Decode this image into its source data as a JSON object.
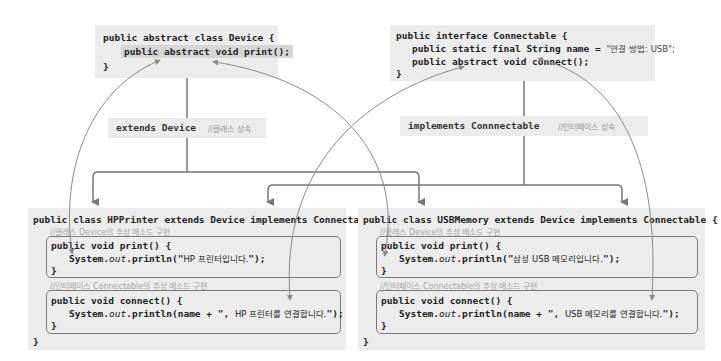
{
  "device": {
    "line1": "public abstract class Device {",
    "line2": "public abstract void print();",
    "line3": "}"
  },
  "connectable": {
    "line1": "public interface Connectable {",
    "line2_prefix": "public static final String name = ",
    "line2_value": "\"연결 방법: USB\";",
    "line3": "public abstract void connect();",
    "line4": "}"
  },
  "extends_label": {
    "keyword": "extends Device",
    "comment": "//클래스 상속"
  },
  "implements_label": {
    "keyword": "implements Connnectable",
    "comment": "//인터페이스 상속"
  },
  "hpprinter": {
    "header": "public class HPPrinter extends Device implements Connectable {",
    "comment1": "//클래스 Device의 추상 메소드 구현",
    "print_sig": "public void print() {",
    "print_body_prefix": "System.",
    "print_body_out": "out",
    "print_body_mid": ".println(\"",
    "print_body_text": "HP 프린터입니다.",
    "print_body_suffix": "\");",
    "close": "}",
    "comment2": "//인터페이스 Connectable의 추상 메소드 구현",
    "connect_sig": "public void connect() {",
    "connect_body_prefix": "System.",
    "connect_body_out": "out",
    "connect_body_mid": ".println(name + \", ",
    "connect_body_text": "HP 프린터를 연결합니다.",
    "connect_body_suffix": "\");",
    "class_close": "}"
  },
  "usbmemory": {
    "header": "public class USBMemory extends Device implements Connectable {",
    "comment1": "//클래스 Device의 추상 메소드 구현",
    "print_sig": "public void print() {",
    "print_body_prefix": "System.",
    "print_body_out": "out",
    "print_body_mid": ".println(\"",
    "print_body_text": "삼성 USB 메모리입니다.",
    "print_body_suffix": "\");",
    "close": "}",
    "comment2": "//인터페이스 Connectable의 추상 메소드 구현",
    "connect_sig": "public void connect() {",
    "connect_body_prefix": "System.",
    "connect_body_out": "out",
    "connect_body_mid": ".println(name + \", ",
    "connect_body_text": "USB 메모리를 연결합니다.",
    "connect_body_suffix": "\");",
    "class_close": "}"
  },
  "colors": {
    "box_bg": "#ececec",
    "highlight": "#d6d6d6",
    "arrow": "#777777",
    "curve": "#8a8a8a",
    "comment": "#a8a8a8"
  }
}
